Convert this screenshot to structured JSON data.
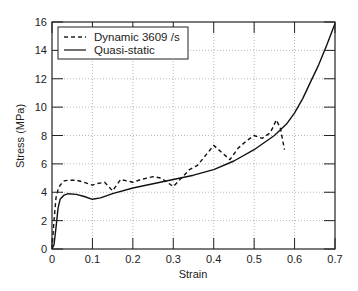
{
  "chart_data": {
    "type": "line",
    "title": "",
    "xlabel": "Strain",
    "ylabel": "Stress (MPa)",
    "xlim": [
      0,
      0.7
    ],
    "ylim": [
      0,
      16
    ],
    "xticks": [
      "0",
      "0.1",
      "0.2",
      "0.3",
      "0.4",
      "0.5",
      "0.6",
      "0.7"
    ],
    "yticks": [
      "0",
      "2",
      "4",
      "6",
      "8",
      "10",
      "12",
      "14",
      "16"
    ],
    "grid": true,
    "legend_position": "upper left",
    "series": [
      {
        "name": "Dynamic 3609 /s",
        "style": "dashed",
        "x": [
          0.0,
          0.005,
          0.01,
          0.015,
          0.02,
          0.03,
          0.04,
          0.06,
          0.08,
          0.1,
          0.11,
          0.13,
          0.15,
          0.17,
          0.2,
          0.22,
          0.25,
          0.27,
          0.3,
          0.32,
          0.34,
          0.36,
          0.38,
          0.4,
          0.42,
          0.44,
          0.46,
          0.48,
          0.5,
          0.52,
          0.54,
          0.555,
          0.565,
          0.575
        ],
        "y": [
          0.0,
          2.0,
          3.6,
          4.2,
          4.5,
          4.8,
          4.85,
          4.85,
          4.7,
          4.5,
          4.6,
          4.7,
          4.1,
          4.9,
          4.7,
          4.9,
          5.1,
          5.0,
          4.4,
          5.0,
          5.6,
          5.9,
          6.6,
          7.3,
          6.8,
          6.3,
          7.1,
          7.6,
          8.0,
          7.8,
          8.2,
          9.1,
          8.5,
          7.0
        ]
      },
      {
        "name": "Quasi-static",
        "style": "solid",
        "x": [
          0.0,
          0.005,
          0.01,
          0.015,
          0.02,
          0.03,
          0.04,
          0.06,
          0.08,
          0.1,
          0.12,
          0.15,
          0.2,
          0.25,
          0.3,
          0.35,
          0.4,
          0.45,
          0.5,
          0.55,
          0.58,
          0.6,
          0.62,
          0.64,
          0.66,
          0.68,
          0.7
        ],
        "y": [
          0.0,
          0.3,
          1.5,
          2.9,
          3.5,
          3.8,
          3.9,
          3.85,
          3.7,
          3.5,
          3.6,
          3.9,
          4.3,
          4.6,
          4.9,
          5.2,
          5.6,
          6.2,
          7.0,
          8.0,
          8.8,
          9.6,
          10.6,
          11.8,
          13.0,
          14.4,
          15.9
        ]
      }
    ]
  }
}
